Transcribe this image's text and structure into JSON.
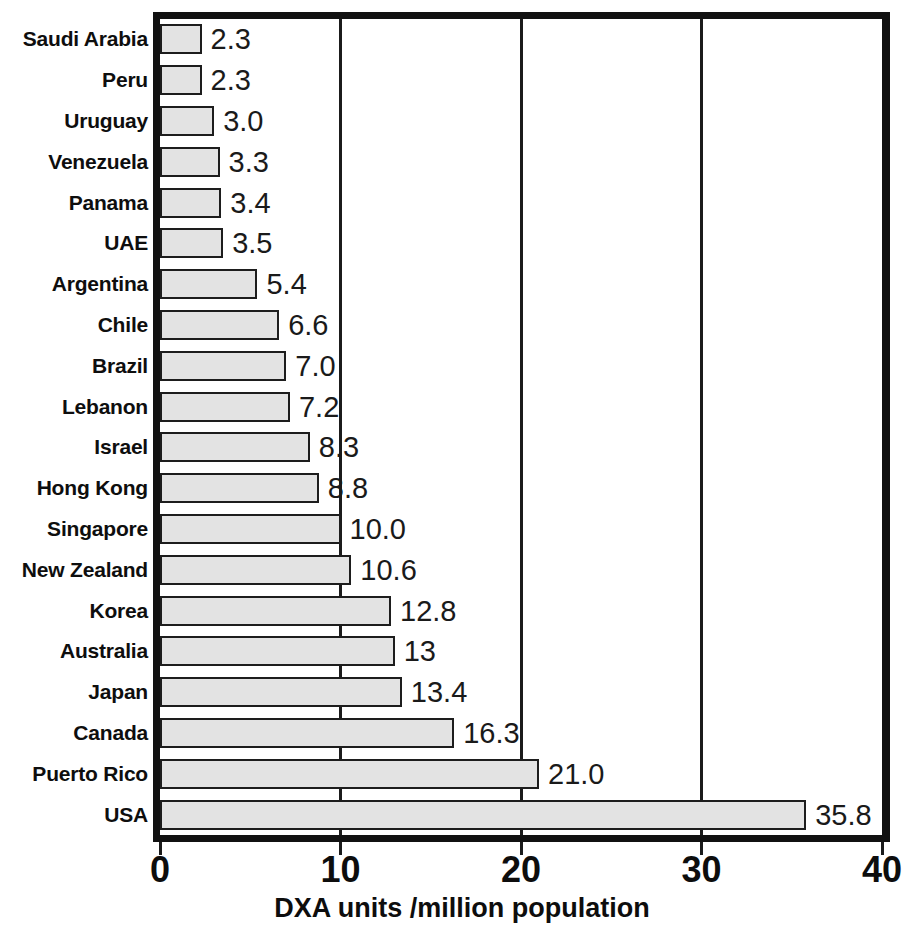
{
  "chart_data": {
    "type": "bar",
    "orientation": "horizontal",
    "title": "",
    "xlabel": "DXA units /million population",
    "ylabel": "",
    "xlim": [
      0,
      40
    ],
    "xticks": [
      "0",
      "10",
      "20",
      "30",
      "40"
    ],
    "xtick_values": [
      0,
      10,
      20,
      30,
      40
    ],
    "grid": "vertical gridlines at 10, 20, 30",
    "gridlines": [
      10,
      20,
      30
    ],
    "legend": null,
    "categories": [
      "Saudi Arabia",
      "Peru",
      "Uruguay",
      "Venezuela",
      "Panama",
      "UAE",
      "Argentina",
      "Chile",
      "Brazil",
      "Lebanon",
      "Israel",
      "Hong Kong",
      "Singapore",
      "New Zealand",
      "Korea",
      "Australia",
      "Japan",
      "Canada",
      "Puerto Rico",
      "USA"
    ],
    "values": [
      2.3,
      2.3,
      3.0,
      3.3,
      3.4,
      3.5,
      5.4,
      6.6,
      7.0,
      7.2,
      8.3,
      8.8,
      10.0,
      10.6,
      12.8,
      13,
      13.4,
      16.3,
      21.0,
      35.8
    ],
    "value_labels": [
      "2.3",
      "2.3",
      "3.0",
      "3.3",
      "3.4",
      "3.5",
      "5.4",
      "6.6",
      "7.0",
      "7.2",
      "8.3",
      "8.8",
      "10.0",
      "10.6",
      "12.8",
      "13",
      "13.4",
      "16.3",
      "21.0",
      "35.8"
    ],
    "bar_fill_color": "#e3e3e3",
    "bar_border_color": "#1d1d1d",
    "axis_color": "#111111"
  }
}
